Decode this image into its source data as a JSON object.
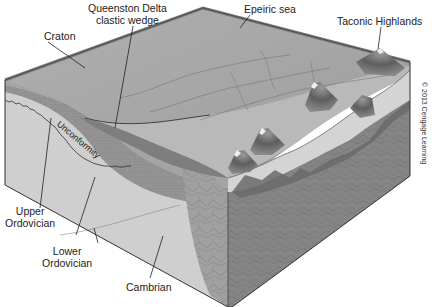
{
  "figure": {
    "type": "geologic-block-diagram",
    "labels": {
      "craton": "Craton",
      "queenston_line1": "Queenston Delta",
      "queenston_line2": "clastic wedge",
      "epeiric_sea": "Epeiric sea",
      "taconic_highlands": "Taconic Highlands",
      "unconformity": "Unconformity",
      "upper_ordovician_line1": "Upper",
      "upper_ordovician_line2": "Ordovician",
      "lower_ordovician_line1": "Lower",
      "lower_ordovician_line2": "Ordovician",
      "cambrian": "Cambrian"
    },
    "credit": "© 2013 Cengage Learning",
    "colors": {
      "background": "#ffffff",
      "sea_surface": "#a8a8a8",
      "sea_edge": "#8c8c8c",
      "delta_surface": "#b9b9b9",
      "lowland": "#c8c8c8",
      "mountain": "#6e6e6e",
      "snowcap": "#efefef",
      "clastic_wedge": "#7a7a7a",
      "upper_ordovician": "#9a9a9a",
      "lower_ordovician": "#8e8e8e",
      "cambrian": "#cfcfcf",
      "basement_front": "#a9a9a9",
      "basement_side": "#858585",
      "outline": "#333333"
    }
  }
}
